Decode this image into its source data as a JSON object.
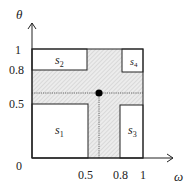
{
  "diagram": {
    "axes": {
      "x_label": "ω",
      "y_label": "θ",
      "x_ticks": [
        {
          "value": "0",
          "label": "0"
        },
        {
          "value": "0.5",
          "label": "0.5"
        },
        {
          "value": "0.8",
          "label": "0.8"
        },
        {
          "value": "1",
          "label": "1"
        }
      ],
      "y_ticks": [
        {
          "value": "0.5",
          "label": "0.5"
        },
        {
          "value": "0.8",
          "label": "0.8"
        },
        {
          "value": "1",
          "label": "1"
        }
      ]
    },
    "regions": [
      {
        "id": "s1",
        "base": "s",
        "sub": "1",
        "omega": [
          0,
          0.5
        ],
        "theta": [
          0,
          0.5
        ]
      },
      {
        "id": "s2",
        "base": "s",
        "sub": "2",
        "omega": [
          0,
          0.5
        ],
        "theta": [
          0.8,
          1
        ]
      },
      {
        "id": "s3",
        "base": "s",
        "sub": "3",
        "omega": [
          0.8,
          1
        ],
        "theta": [
          0,
          0.5
        ]
      },
      {
        "id": "s4",
        "base": "s",
        "sub": "4",
        "omega": [
          0.8,
          1
        ],
        "theta": [
          0.8,
          1
        ]
      }
    ],
    "shaded_band": "hatched cross region between the four s-regions",
    "point": {
      "marker": "filled-circle",
      "description": "point at intersection of dotted lines"
    },
    "colors": {
      "line": "#222222",
      "hatch_fill": "#e6e6e6",
      "point": "#000000"
    }
  }
}
